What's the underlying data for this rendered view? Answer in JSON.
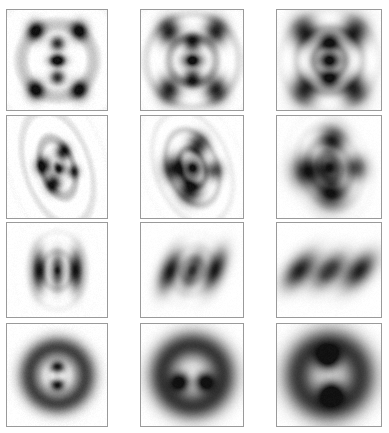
{
  "figure": {
    "kind": "image-grid",
    "rows": 4,
    "columns": 3,
    "width": 389,
    "height": 433,
    "background_color": "#ffffff",
    "panel_border_color": "#9a9a9a",
    "colormap": "grayscale-inverted",
    "column_labels": [
      "",
      "",
      ""
    ],
    "row_labels": [
      "",
      "",
      "",
      ""
    ],
    "column_geometry": [
      {
        "x": 6,
        "width": 102
      },
      {
        "x": 140,
        "width": 104
      },
      {
        "x": 276,
        "width": 106
      }
    ],
    "row_geometry": [
      {
        "y": 9,
        "height": 102
      },
      {
        "y": 115,
        "height": 104
      },
      {
        "y": 222,
        "height": 96
      },
      {
        "y": 323,
        "height": 104
      }
    ]
  },
  "chart_data": {
    "type": "heatmap",
    "title": "",
    "xlabel": "",
    "ylabel": "",
    "grid": false,
    "legend": "none",
    "colormap": "grayscale-inverted",
    "value_range": [
      0,
      1
    ],
    "panels": [
      {
        "row": 0,
        "col": 0,
        "name": "panel-r1c1",
        "pattern": "rings-plus-cluster",
        "ring_count": 9,
        "ring_spacing": 5.5,
        "ring_amplitude": 0.3,
        "blur": 0.7,
        "rotation_deg": 0,
        "noise": 0.05,
        "lobes": [
          {
            "x": -0.22,
            "y": -0.3,
            "rx": 0.085,
            "ry": 0.095,
            "amp": 1.0,
            "rot": 0
          },
          {
            "x": 0.22,
            "y": -0.3,
            "rx": 0.085,
            "ry": 0.095,
            "amp": 1.0,
            "rot": 0
          },
          {
            "x": 0.0,
            "y": -0.17,
            "rx": 0.07,
            "ry": 0.07,
            "amp": 0.9,
            "rot": 0
          },
          {
            "x": 0.0,
            "y": 0.0,
            "rx": 0.085,
            "ry": 0.055,
            "amp": 1.0,
            "rot": 0
          },
          {
            "x": 0.0,
            "y": 0.17,
            "rx": 0.07,
            "ry": 0.07,
            "amp": 0.9,
            "rot": 0
          },
          {
            "x": -0.22,
            "y": 0.3,
            "rx": 0.085,
            "ry": 0.095,
            "amp": 1.0,
            "rot": 0
          },
          {
            "x": 0.22,
            "y": 0.3,
            "rx": 0.085,
            "ry": 0.095,
            "amp": 1.0,
            "rot": 0
          }
        ]
      },
      {
        "row": 0,
        "col": 1,
        "name": "panel-r1c2",
        "pattern": "rings-plus-cluster",
        "ring_count": 6,
        "ring_spacing": 8.5,
        "ring_amplitude": 0.34,
        "blur": 1.9,
        "rotation_deg": 0,
        "noise": 0.04,
        "lobes": [
          {
            "x": -0.24,
            "y": -0.3,
            "rx": 0.11,
            "ry": 0.13,
            "amp": 1.0,
            "rot": 0
          },
          {
            "x": 0.24,
            "y": -0.3,
            "rx": 0.11,
            "ry": 0.13,
            "amp": 1.0,
            "rot": 0
          },
          {
            "x": 0.0,
            "y": -0.18,
            "rx": 0.085,
            "ry": 0.085,
            "amp": 0.95,
            "rot": 0
          },
          {
            "x": 0.0,
            "y": 0.0,
            "rx": 0.1,
            "ry": 0.065,
            "amp": 1.0,
            "rot": 0
          },
          {
            "x": 0.0,
            "y": 0.18,
            "rx": 0.085,
            "ry": 0.085,
            "amp": 0.95,
            "rot": 0
          },
          {
            "x": -0.24,
            "y": 0.3,
            "rx": 0.11,
            "ry": 0.13,
            "amp": 1.0,
            "rot": 0
          },
          {
            "x": 0.24,
            "y": 0.3,
            "rx": 0.11,
            "ry": 0.13,
            "amp": 1.0,
            "rot": 0
          }
        ]
      },
      {
        "row": 0,
        "col": 2,
        "name": "panel-r1c3",
        "pattern": "rings-plus-cluster",
        "ring_count": 4,
        "ring_spacing": 12.0,
        "ring_amplitude": 0.38,
        "blur": 3.0,
        "rotation_deg": 0,
        "noise": 0.03,
        "lobes": [
          {
            "x": -0.26,
            "y": -0.3,
            "rx": 0.13,
            "ry": 0.15,
            "amp": 1.0,
            "rot": 0
          },
          {
            "x": 0.26,
            "y": -0.3,
            "rx": 0.13,
            "ry": 0.15,
            "amp": 1.0,
            "rot": 0
          },
          {
            "x": 0.0,
            "y": -0.19,
            "rx": 0.1,
            "ry": 0.1,
            "amp": 1.0,
            "rot": 0
          },
          {
            "x": 0.0,
            "y": 0.0,
            "rx": 0.12,
            "ry": 0.075,
            "amp": 1.0,
            "rot": 0
          },
          {
            "x": 0.0,
            "y": 0.19,
            "rx": 0.1,
            "ry": 0.1,
            "amp": 1.0,
            "rot": 0
          },
          {
            "x": -0.26,
            "y": 0.31,
            "rx": 0.13,
            "ry": 0.15,
            "amp": 1.0,
            "rot": 0
          },
          {
            "x": 0.26,
            "y": 0.31,
            "rx": 0.13,
            "ry": 0.15,
            "amp": 1.0,
            "rot": 0
          }
        ]
      },
      {
        "row": 1,
        "col": 0,
        "name": "panel-r2c1",
        "pattern": "elliptical-rings-cluster",
        "ring_count": 5,
        "ring_spacing": 9.0,
        "ring_amplitude": 0.34,
        "ring_aspect": 1.35,
        "blur": 1.1,
        "rotation_deg": -18,
        "noise": 0.05,
        "lobes": [
          {
            "x": -0.13,
            "y": -0.06,
            "rx": 0.075,
            "ry": 0.085,
            "amp": 1.0,
            "rot": 0
          },
          {
            "x": 0.1,
            "y": -0.13,
            "rx": 0.07,
            "ry": 0.08,
            "amp": 0.95,
            "rot": 0
          },
          {
            "x": 0.02,
            "y": 0.02,
            "rx": 0.055,
            "ry": 0.055,
            "amp": 0.8,
            "rot": 0
          },
          {
            "x": -0.09,
            "y": 0.14,
            "rx": 0.075,
            "ry": 0.085,
            "amp": 1.0,
            "rot": 0
          },
          {
            "x": 0.14,
            "y": 0.09,
            "rx": 0.06,
            "ry": 0.065,
            "amp": 0.75,
            "rot": 0
          }
        ]
      },
      {
        "row": 1,
        "col": 1,
        "name": "panel-r2c2",
        "pattern": "elliptical-rings-cluster",
        "ring_count": 4,
        "ring_spacing": 13.0,
        "ring_amplitude": 0.36,
        "ring_aspect": 1.25,
        "blur": 2.4,
        "rotation_deg": -20,
        "noise": 0.04,
        "lobes": [
          {
            "x": -0.17,
            "y": -0.05,
            "rx": 0.11,
            "ry": 0.12,
            "amp": 1.0,
            "rot": 0
          },
          {
            "x": 0.13,
            "y": -0.19,
            "rx": 0.095,
            "ry": 0.105,
            "amp": 0.9,
            "rot": 0
          },
          {
            "x": 0.01,
            "y": 0.01,
            "rx": 0.08,
            "ry": 0.08,
            "amp": 0.85,
            "rot": 0
          },
          {
            "x": -0.1,
            "y": 0.2,
            "rx": 0.11,
            "ry": 0.12,
            "amp": 1.0,
            "rot": 0
          },
          {
            "x": 0.19,
            "y": 0.1,
            "rx": 0.085,
            "ry": 0.09,
            "amp": 0.75,
            "rot": 0
          }
        ]
      },
      {
        "row": 1,
        "col": 2,
        "name": "panel-r2c3",
        "pattern": "elliptical-rings-cluster",
        "ring_count": 3,
        "ring_spacing": 17.0,
        "ring_amplitude": 0.3,
        "ring_aspect": 1.18,
        "blur": 3.6,
        "rotation_deg": -22,
        "noise": 0.03,
        "lobes": [
          {
            "x": -0.22,
            "y": -0.05,
            "rx": 0.145,
            "ry": 0.15,
            "amp": 1.0,
            "rot": 0
          },
          {
            "x": 0.13,
            "y": -0.24,
            "rx": 0.125,
            "ry": 0.13,
            "amp": 0.95,
            "rot": 0
          },
          {
            "x": 0.01,
            "y": 0.0,
            "rx": 0.1,
            "ry": 0.1,
            "amp": 0.9,
            "rot": 0
          },
          {
            "x": -0.08,
            "y": 0.24,
            "rx": 0.15,
            "ry": 0.15,
            "amp": 1.0,
            "rot": 0
          },
          {
            "x": 0.24,
            "y": 0.1,
            "rx": 0.11,
            "ry": 0.115,
            "amp": 0.8,
            "rot": 0
          }
        ]
      },
      {
        "row": 2,
        "col": 0,
        "name": "panel-r3c1",
        "pattern": "three-lobes",
        "ring_count": 3,
        "ring_spacing": 11.0,
        "ring_amplitude": 0.16,
        "ring_aspect": 1.15,
        "blur": 1.4,
        "rotation_deg": 0,
        "noise": 0.04,
        "lobes": [
          {
            "x": -0.2,
            "y": 0.0,
            "rx": 0.075,
            "ry": 0.2,
            "amp": 1.0,
            "rot": 0
          },
          {
            "x": 0.0,
            "y": 0.0,
            "rx": 0.065,
            "ry": 0.175,
            "amp": 0.85,
            "rot": 0
          },
          {
            "x": 0.2,
            "y": 0.0,
            "rx": 0.075,
            "ry": 0.2,
            "amp": 1.0,
            "rot": 0
          }
        ]
      },
      {
        "row": 2,
        "col": 1,
        "name": "panel-r3c2",
        "pattern": "three-lobes",
        "ring_count": 2,
        "ring_spacing": 16.0,
        "ring_amplitude": 0.14,
        "ring_aspect": 1.1,
        "blur": 2.6,
        "rotation_deg": 22,
        "noise": 0.03,
        "lobes": [
          {
            "x": -0.22,
            "y": 0.1,
            "rx": 0.095,
            "ry": 0.215,
            "amp": 1.0,
            "rot": 22
          },
          {
            "x": 0.0,
            "y": 0.0,
            "rx": 0.085,
            "ry": 0.195,
            "amp": 0.9,
            "rot": 22
          },
          {
            "x": 0.22,
            "y": -0.1,
            "rx": 0.095,
            "ry": 0.215,
            "amp": 1.0,
            "rot": 22
          }
        ]
      },
      {
        "row": 2,
        "col": 2,
        "name": "panel-r3c3",
        "pattern": "three-lobes",
        "ring_count": 2,
        "ring_spacing": 20.0,
        "ring_amplitude": 0.13,
        "ring_aspect": 1.05,
        "blur": 3.8,
        "rotation_deg": 42,
        "noise": 0.03,
        "lobes": [
          {
            "x": -0.24,
            "y": 0.22,
            "rx": 0.115,
            "ry": 0.225,
            "amp": 1.0,
            "rot": 42
          },
          {
            "x": 0.0,
            "y": 0.0,
            "rx": 0.105,
            "ry": 0.205,
            "amp": 0.9,
            "rot": 42
          },
          {
            "x": 0.24,
            "y": -0.22,
            "rx": 0.115,
            "ry": 0.225,
            "amp": 1.0,
            "rot": 42
          }
        ]
      },
      {
        "row": 3,
        "col": 0,
        "name": "panel-r4c1",
        "pattern": "annulus-with-core",
        "annulus_radius": 0.28,
        "annulus_thickness": 0.115,
        "annulus_amp": 0.8,
        "annulus_aspect": 1.0,
        "ring_count": 1,
        "ring_spacing": 22.0,
        "ring_amplitude": 0.1,
        "blur": 2.0,
        "rotation_deg": 0,
        "noise": 0.04,
        "lobes": [
          {
            "x": 0.0,
            "y": -0.085,
            "rx": 0.065,
            "ry": 0.055,
            "amp": 1.0,
            "rot": 0
          },
          {
            "x": 0.0,
            "y": 0.095,
            "rx": 0.065,
            "ry": 0.055,
            "amp": 1.0,
            "rot": 0
          }
        ]
      },
      {
        "row": 3,
        "col": 1,
        "name": "panel-r4c2",
        "pattern": "annulus-with-core",
        "annulus_radius": 0.3,
        "annulus_thickness": 0.145,
        "annulus_amp": 0.85,
        "annulus_aspect": 1.0,
        "ring_count": 1,
        "ring_spacing": 26.0,
        "ring_amplitude": 0.09,
        "blur": 3.0,
        "rotation_deg": 0,
        "noise": 0.03,
        "lobes": [
          {
            "x": -0.115,
            "y": 0.06,
            "rx": 0.085,
            "ry": 0.085,
            "amp": 1.0,
            "rot": 0
          },
          {
            "x": 0.115,
            "y": 0.06,
            "rx": 0.085,
            "ry": 0.085,
            "amp": 1.0,
            "rot": 0
          }
        ]
      },
      {
        "row": 3,
        "col": 2,
        "name": "panel-r4c3",
        "pattern": "annulus-with-core",
        "annulus_radius": 0.31,
        "annulus_thickness": 0.165,
        "annulus_amp": 0.85,
        "annulus_aspect": 1.0,
        "ring_count": 1,
        "ring_spacing": 30.0,
        "ring_amplitude": 0.08,
        "blur": 3.8,
        "rotation_deg": 40,
        "noise": 0.03,
        "lobes": [
          {
            "x": -0.115,
            "y": -0.115,
            "rx": 0.105,
            "ry": 0.105,
            "amp": 1.0,
            "rot": 0
          },
          {
            "x": 0.115,
            "y": 0.115,
            "rx": 0.105,
            "ry": 0.105,
            "amp": 1.0,
            "rot": 0
          }
        ]
      }
    ]
  }
}
